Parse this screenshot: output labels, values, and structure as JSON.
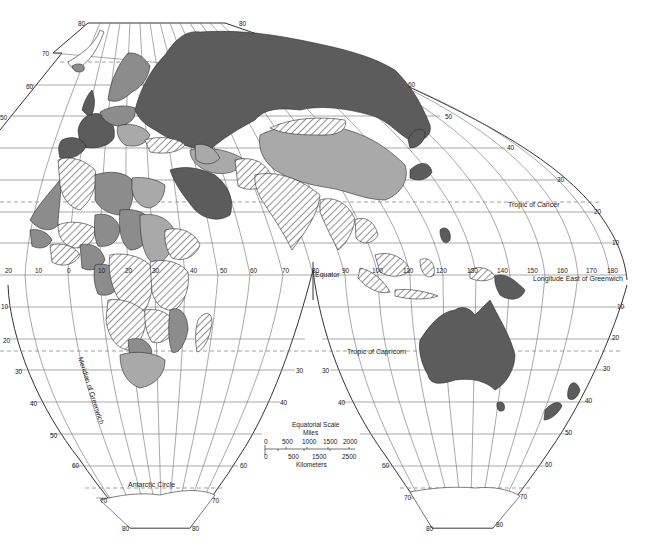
{
  "map": {
    "projection": "interrupted equal-area world map (Eastern Hemisphere)",
    "legend_fill_colors": {
      "dark": "#5c5c5c",
      "medium": "#8c8c8c",
      "light": "#a9a9a9",
      "hatched": "diagonal hatch",
      "background": "#ffffff"
    },
    "line_labels": {
      "equator": "Equator",
      "tropic_cancer": "Tropic of Cancer",
      "tropic_capricorn": "Tropic of Capricorn",
      "antarctic_circle": "Antarctic Circle",
      "longitude_east": "Longitude East of Greenwich",
      "meridian_greenwich": "Meridian of Greenwich"
    },
    "longitude_ticks_equator": [
      "20",
      "10",
      "0",
      "10",
      "20",
      "30",
      "40",
      "50",
      "60",
      "70",
      "80",
      "90",
      "100",
      "110",
      "120",
      "130",
      "140",
      "150",
      "160",
      "170",
      "180"
    ],
    "latitude_labels_left_north": [
      "80",
      "70",
      "60",
      "50"
    ],
    "latitude_labels_top_right": [
      "80",
      "60",
      "50",
      "40",
      "30",
      "20",
      "10"
    ],
    "latitude_labels_south_left_lobe": [
      "10",
      "20",
      "30",
      "40",
      "50",
      "60",
      "70",
      "80"
    ],
    "latitude_labels_south_left_lobe_right": [
      "30",
      "40",
      "60",
      "70",
      "80"
    ],
    "latitude_labels_south_right_lobe_left": [
      "30",
      "40",
      "60",
      "70",
      "80"
    ],
    "latitude_labels_south_right_lobe_right": [
      "10",
      "20",
      "30",
      "40",
      "50",
      "60",
      "70",
      "80"
    ],
    "scale": {
      "title": "Equatorial Scale",
      "miles_label": "Miles",
      "miles_ticks": [
        "0",
        "500",
        "1000",
        "1500",
        "2000"
      ],
      "km_ticks": [
        "0",
        "500",
        "1500",
        "2500"
      ],
      "km_label": "Kilometers"
    }
  }
}
